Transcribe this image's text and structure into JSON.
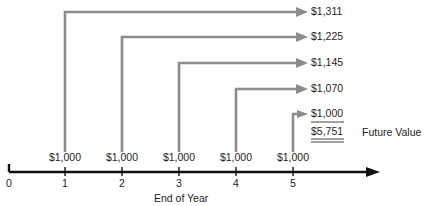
{
  "diagram": {
    "title": "",
    "payment_amount": "$1,000",
    "cash_flows": [
      {
        "year": "1",
        "amount": "$1,000",
        "future_value": "$1,311"
      },
      {
        "year": "2",
        "amount": "$1,000",
        "future_value": "$1,225"
      },
      {
        "year": "3",
        "amount": "$1,000",
        "future_value": "$1,145"
      },
      {
        "year": "4",
        "amount": "$1,000",
        "future_value": "$1,070"
      },
      {
        "year": "5",
        "amount": "$1,000",
        "future_value": "$1,000"
      }
    ],
    "total": "$5,751",
    "total_label": "Future Value",
    "axis": {
      "ticks": [
        "0",
        "1",
        "2",
        "3",
        "4",
        "5"
      ],
      "label": "End of Year"
    },
    "colors": {
      "flow_lines": "#8c8c8c",
      "axis": "#111111",
      "text": "#1e1e1e"
    }
  }
}
